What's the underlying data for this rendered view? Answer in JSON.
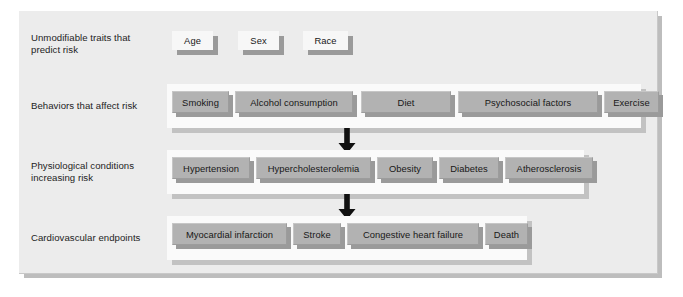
{
  "figure": {
    "background_color": "#ececec",
    "panel_color": "#fafafa",
    "box_color": "#b2b2b2",
    "arrow_color": "#111111"
  },
  "rows": [
    {
      "label": "Unmodifiable traits that\npredict risk",
      "style": "white",
      "items": [
        {
          "label": "Age",
          "x": 172,
          "y": 31,
          "w": 41,
          "h": 19
        },
        {
          "label": "Sex",
          "x": 238,
          "y": 31,
          "w": 41,
          "h": 19
        },
        {
          "label": "Race",
          "x": 303,
          "y": 31,
          "w": 45,
          "h": 19
        }
      ]
    },
    {
      "label": "Behaviors that affect risk",
      "style": "grey",
      "panel": {
        "x": 167,
        "y": 84,
        "w": 474,
        "h": 44
      },
      "items": [
        {
          "label": "Smoking",
          "x": 172,
          "y": 91,
          "w": 57,
          "h": 22
        },
        {
          "label": "Alcohol consumption",
          "x": 235,
          "y": 91,
          "w": 118,
          "h": 22
        },
        {
          "label": "Diet",
          "x": 361,
          "y": 91,
          "w": 90,
          "h": 22
        },
        {
          "label": "Psychosocial factors",
          "x": 458,
          "y": 91,
          "w": 140,
          "h": 22
        },
        {
          "label": "Exercise",
          "x": 604,
          "y": 91,
          "w": 55,
          "h": 22
        }
      ]
    },
    {
      "label": "Physiological conditions\nincreasing risk",
      "style": "grey",
      "panel": {
        "x": 167,
        "y": 150,
        "w": 417,
        "h": 44
      },
      "items": [
        {
          "label": "Hypertension",
          "x": 172,
          "y": 157,
          "w": 78,
          "h": 22
        },
        {
          "label": "Hypercholesterolemia",
          "x": 256,
          "y": 157,
          "w": 115,
          "h": 22
        },
        {
          "label": "Obesity",
          "x": 377,
          "y": 157,
          "w": 56,
          "h": 22
        },
        {
          "label": "Diabetes",
          "x": 439,
          "y": 157,
          "w": 60,
          "h": 22
        },
        {
          "label": "Atherosclerosis",
          "x": 505,
          "y": 157,
          "w": 88,
          "h": 22
        }
      ]
    },
    {
      "label": "Cardiovascular endpoints",
      "style": "grey",
      "panel": {
        "x": 167,
        "y": 216,
        "w": 360,
        "h": 44
      },
      "items": [
        {
          "label": "Myocardial infarction",
          "x": 172,
          "y": 223,
          "w": 115,
          "h": 22
        },
        {
          "label": "Stroke",
          "x": 293,
          "y": 223,
          "w": 48,
          "h": 22
        },
        {
          "label": "Congestive heart failure",
          "x": 347,
          "y": 223,
          "w": 132,
          "h": 22
        },
        {
          "label": "Death",
          "x": 485,
          "y": 223,
          "w": 43,
          "h": 22
        }
      ]
    }
  ],
  "arrows": [
    {
      "name": "arrow-behaviors-to-physiological",
      "x": 337,
      "y": 128
    },
    {
      "name": "arrow-physiological-to-endpoints",
      "x": 337,
      "y": 194
    }
  ]
}
